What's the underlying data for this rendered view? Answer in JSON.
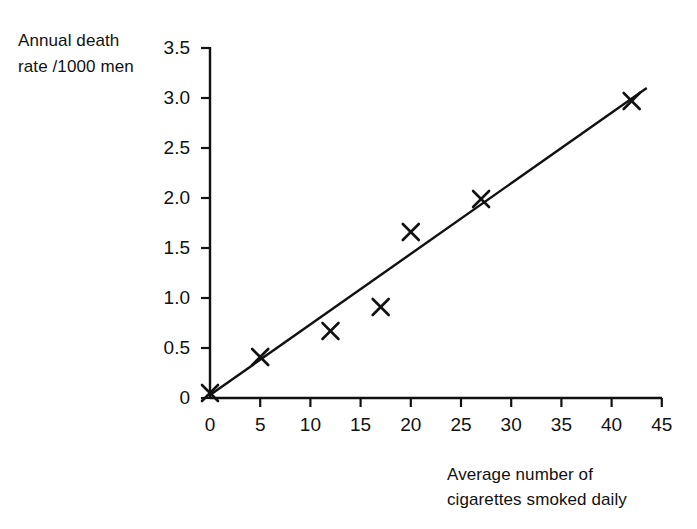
{
  "chart_data": {
    "type": "scatter",
    "title": "",
    "xlabel": "Average number of cigarettes smoked daily",
    "ylabel": "Annual death rate /1000 men",
    "ylabel_line1": "Annual death",
    "ylabel_line2": "rate /1000 men",
    "xlabel_line1": "Average number of",
    "xlabel_line2": "cigarettes smoked daily",
    "xlim": [
      0,
      45
    ],
    "ylim": [
      0,
      3.5
    ],
    "xticks": [
      0,
      5,
      10,
      15,
      20,
      25,
      30,
      35,
      40,
      45
    ],
    "xtick_labels": [
      "0",
      "5",
      "10",
      "15",
      "20",
      "25",
      "30",
      "35",
      "40",
      "45"
    ],
    "yticks": [
      0,
      0.5,
      1.0,
      1.5,
      2.0,
      2.5,
      3.0,
      3.5
    ],
    "ytick_labels": [
      "0",
      "0.5",
      "1.0",
      "1.5",
      "2.0",
      "2.5",
      "3.0",
      "3.5"
    ],
    "grid": false,
    "legend": null,
    "marker": "x-cross",
    "marker_color": "#111111",
    "line_color": "#111111",
    "x": [
      0,
      5,
      12,
      17,
      20,
      27,
      42
    ],
    "y": [
      0.05,
      0.41,
      0.67,
      0.91,
      1.66,
      1.99,
      2.97
    ],
    "points": [
      {
        "x": 0,
        "y": 0.05
      },
      {
        "x": 5,
        "y": 0.41
      },
      {
        "x": 12,
        "y": 0.67
      },
      {
        "x": 17,
        "y": 0.91
      },
      {
        "x": 20,
        "y": 1.66
      },
      {
        "x": 27,
        "y": 1.99
      },
      {
        "x": 42,
        "y": 2.97
      }
    ],
    "trendline": {
      "type": "line-of-best-fit",
      "x_start": 0,
      "y_start": 0.03,
      "x_end": 43.5,
      "y_end": 3.1
    }
  },
  "axes": {
    "y_axis_name": "y-axis",
    "x_axis_name": "x-axis"
  }
}
